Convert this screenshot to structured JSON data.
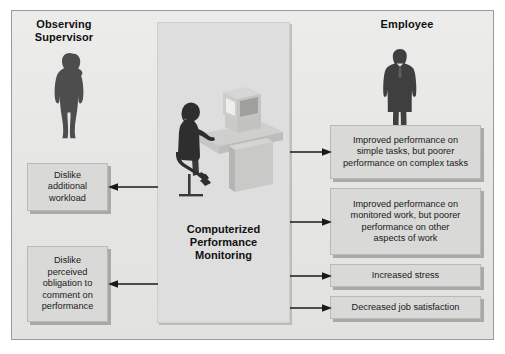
{
  "figure": {
    "title": "Computerized Performance Monitoring",
    "center_panel_label": "Computerized\nPerformance\nMonitoring",
    "headings": {
      "left": "Observing\nSupervisor",
      "right": "Employee"
    },
    "colors": {
      "canvas": "#e9e9e7",
      "center_panel": "#dedede",
      "box_fill": "#d9d9d7",
      "box_border": "#b9b9b7",
      "text": "#1a1a1a",
      "arrow": "#1a1a1a",
      "silhouette": "#4a4a4a",
      "frame_border": "#9a9a98"
    }
  },
  "supervisor_outcomes": [
    {
      "id": "dislike-workload",
      "text": "Dislike\nadditional\nworkload",
      "arrow_direction": "left"
    },
    {
      "id": "dislike-obligation",
      "text": "Dislike\nperceived\nobligation to\ncomment on\nperformance",
      "arrow_direction": "left"
    }
  ],
  "employee_outcomes": [
    {
      "id": "simple-tasks",
      "text": "Improved performance on\nsimple tasks, but poorer\nperformance on complex tasks",
      "arrow_direction": "right"
    },
    {
      "id": "monitored-work",
      "text": "Improved performance on\nmonitored work, but poorer\nperformance on other\naspects of work",
      "arrow_direction": "right"
    },
    {
      "id": "increased-stress",
      "text": "Increased stress",
      "arrow_direction": "right"
    },
    {
      "id": "decreased-satisfaction",
      "text": "Decreased job satisfaction",
      "arrow_direction": "right"
    }
  ],
  "illustration": {
    "scene_label": "worker-at-computer-workstation",
    "elements": [
      "seated-worker-silhouette",
      "office-chair",
      "crt-monitor",
      "desk"
    ]
  }
}
